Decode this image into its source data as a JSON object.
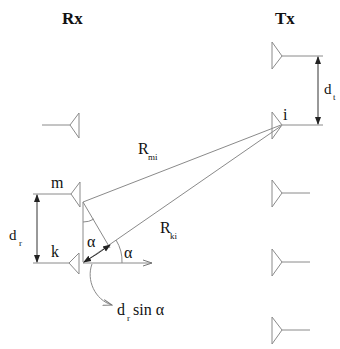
{
  "diagram": {
    "type": "antenna-array-geometry",
    "labels": {
      "rx": "Rx",
      "tx": "Tx",
      "m": "m",
      "k": "k",
      "i": "i",
      "r_mi_base": "R",
      "r_mi_sub": "mi",
      "r_ki_base": "R",
      "r_ki_sub": "ki",
      "d_r_base": "d",
      "d_r_sub": "r",
      "d_t_base": "d",
      "d_t_sub": "t",
      "alpha_inner": "α",
      "alpha_outer": "α",
      "path_diff_d": "d",
      "path_diff_sub": "r",
      "path_diff_rest": "sin α"
    },
    "rx_antennas": [
      {
        "id": "rx-top",
        "y": 125,
        "label": ""
      },
      {
        "id": "rx-m",
        "y": 193,
        "label": "m"
      },
      {
        "id": "rx-k",
        "y": 263,
        "label": "k"
      }
    ],
    "tx_antennas": [
      {
        "id": "tx-1",
        "y": 56,
        "label": ""
      },
      {
        "id": "tx-i",
        "y": 125,
        "label": "i"
      },
      {
        "id": "tx-3",
        "y": 193,
        "label": ""
      },
      {
        "id": "tx-4",
        "y": 262,
        "label": ""
      },
      {
        "id": "tx-5",
        "y": 330,
        "label": ""
      }
    ],
    "colors": {
      "line": "#8a8a8a",
      "text": "#111111",
      "arrow": "#222222"
    }
  }
}
